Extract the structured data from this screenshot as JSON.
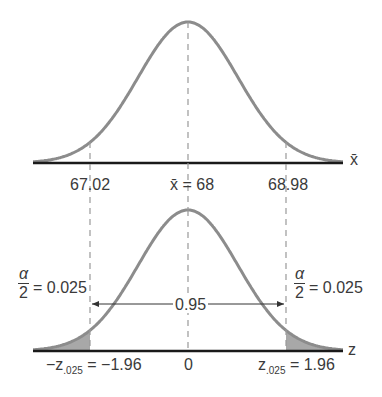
{
  "colors": {
    "curve": "#8c8c8c",
    "axis": "#1a1a1a",
    "shade": "#a8a8a8",
    "dash": "#999999",
    "text": "#3a3a3a"
  },
  "top_plot": {
    "axis_label": "x̄",
    "ticks": [
      {
        "value": "67.02"
      },
      {
        "prefix": "x̄",
        "value": " = 68"
      },
      {
        "value": "68.98"
      }
    ]
  },
  "bottom_plot": {
    "axis_label": "z",
    "central_area": "0.95",
    "tail_left": {
      "num": "α",
      "den": "2",
      "value": "= 0.025"
    },
    "tail_right": {
      "num": "α",
      "den": "2",
      "value": "= 0.025"
    },
    "ticks": [
      {
        "prefix": "−z",
        "sub": ".025",
        "value": " = −1.96"
      },
      {
        "value": "0"
      },
      {
        "prefix": "z",
        "sub": ".025",
        "value": " = 1.96"
      }
    ]
  },
  "chart_data": {
    "type": "line",
    "top": {
      "mean": 68,
      "lower": 67.02,
      "upper": 68.98,
      "xlabel": "x̄"
    },
    "bottom": {
      "mean": 0,
      "z_lower": -1.96,
      "z_upper": 1.96,
      "confidence": 0.95,
      "alpha_half": 0.025,
      "xlabel": "z"
    }
  }
}
